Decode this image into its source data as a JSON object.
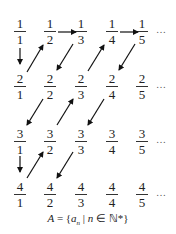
{
  "diagram": {
    "rows": [
      {
        "cells": [
          [
            "1",
            "1"
          ],
          [
            "1",
            "2"
          ],
          [
            "1",
            "3"
          ],
          [
            "1",
            "4"
          ],
          [
            "1",
            "5"
          ]
        ],
        "ellipsis": "…"
      },
      {
        "cells": [
          [
            "2",
            "1"
          ],
          [
            "2",
            "2"
          ],
          [
            "2",
            "3"
          ],
          [
            "2",
            "4"
          ],
          [
            "2",
            "5"
          ]
        ],
        "ellipsis": "…"
      },
      {
        "cells": [
          [
            "3",
            "1"
          ],
          [
            "3",
            "2"
          ],
          [
            "3",
            "3"
          ],
          [
            "3",
            "4"
          ],
          [
            "3",
            "5"
          ]
        ],
        "ellipsis": "…"
      },
      {
        "cells": [
          [
            "4",
            "1"
          ],
          [
            "4",
            "2"
          ],
          [
            "4",
            "3"
          ],
          [
            "4",
            "4"
          ],
          [
            "4",
            "5"
          ]
        ],
        "ellipsis": "…"
      }
    ],
    "arrows": [
      {
        "from": "1/1",
        "to": "2/1",
        "dir": "down"
      },
      {
        "from": "2/1",
        "to": "1/2",
        "dir": "up-right"
      },
      {
        "from": "1/2",
        "to": "1/3",
        "dir": "right"
      },
      {
        "from": "1/3",
        "to": "2/2",
        "dir": "down-left"
      },
      {
        "from": "2/2",
        "to": "3/1",
        "dir": "down-left"
      },
      {
        "from": "3/1",
        "to": "4/1",
        "dir": "down"
      },
      {
        "from": "4/1",
        "to": "3/2",
        "dir": "up-right"
      },
      {
        "from": "3/2",
        "to": "2/3",
        "dir": "up-right"
      },
      {
        "from": "2/3",
        "to": "1/4",
        "dir": "up-right"
      },
      {
        "from": "1/4",
        "to": "1/5",
        "dir": "right"
      },
      {
        "from": "1/5",
        "to": "2/4",
        "dir": "down-left"
      },
      {
        "from": "2/4",
        "to": "3/3",
        "dir": "down-left"
      },
      {
        "from": "3/3",
        "to": "4/2",
        "dir": "down-left"
      }
    ],
    "formula": {
      "lhs": "A",
      "eq": " = {",
      "var": "a",
      "sub": "n",
      "mid": " | ",
      "n": "n",
      "in": " ∈ ",
      "set": "ℕ*",
      "close": "}"
    }
  }
}
